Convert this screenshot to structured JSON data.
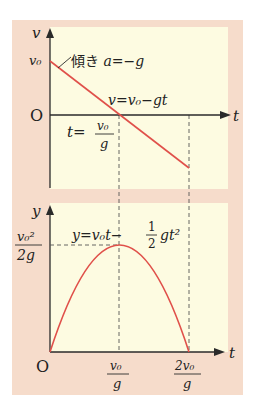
{
  "colors": {
    "outer_panel": "#f6dccb",
    "inner_panel": "#fdfbe1",
    "curve": "#e0504a",
    "axis": "#2a2a2a",
    "dashed": "#555555"
  },
  "top_graph": {
    "y_axis_label": "v",
    "x_axis_label": "t",
    "origin_label": "O",
    "v0_tick_label": "v₀",
    "slope_label": "傾き a=−g",
    "line_equation": "v=v₀−gt",
    "zero_crossing_label_prefix": "t=",
    "zero_crossing_numerator": "v₀",
    "zero_crossing_denominator": "g"
  },
  "bottom_graph": {
    "y_axis_label": "y",
    "x_axis_label": "t",
    "origin_label": "O",
    "peak_label_numerator": "v₀²",
    "peak_label_denominator": "2g",
    "curve_equation_prefix": "y=v₀t−",
    "curve_equation_frac_num": "1",
    "curve_equation_frac_den": "2",
    "curve_equation_suffix": "gt²",
    "tick1_numerator": "v₀",
    "tick1_denominator": "g",
    "tick2_numerator": "2v₀",
    "tick2_denominator": "g"
  }
}
